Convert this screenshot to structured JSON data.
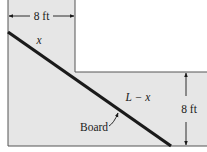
{
  "diagram": {
    "labels": {
      "top_width": "8 ft",
      "right_height": "8 ft",
      "segment_upper": "x",
      "segment_lower": "L − x",
      "board": "Board"
    },
    "colors": {
      "corridor_fill": "#e6e6e6",
      "wall_stroke": "#555555",
      "board": "#1a1a1a",
      "text": "#1a1a1a"
    }
  }
}
